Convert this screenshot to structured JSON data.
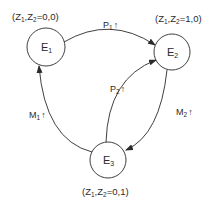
{
  "diagram": {
    "type": "state-transition",
    "states": [
      {
        "id": "E1",
        "label": "E",
        "sub": "1",
        "condition": {
          "prefix": "(Z",
          "s1": "1",
          "mid": ",Z",
          "s2": "2",
          "suffix": "=0,0)"
        }
      },
      {
        "id": "E2",
        "label": "E",
        "sub": "2",
        "condition": {
          "prefix": "(Z",
          "s1": "1",
          "mid": ",Z",
          "s2": "2",
          "suffix": "=1,0)"
        }
      },
      {
        "id": "E3",
        "label": "E",
        "sub": "3",
        "condition": {
          "prefix": "(Z",
          "s1": "1",
          "mid": ",Z",
          "s2": "2",
          "suffix": "=0,1)"
        }
      }
    ],
    "transitions": [
      {
        "from": "E1",
        "to": "E2",
        "label": "P",
        "sub": "1",
        "arrow": "↑"
      },
      {
        "from": "E3",
        "to": "E2",
        "label": "P",
        "sub": "2",
        "arrow": "↑"
      },
      {
        "from": "E2",
        "to": "E3",
        "label": "M",
        "sub": "2",
        "arrow": "↑"
      },
      {
        "from": "E3",
        "to": "E1",
        "label": "M",
        "sub": "1",
        "arrow": "↑"
      }
    ]
  }
}
